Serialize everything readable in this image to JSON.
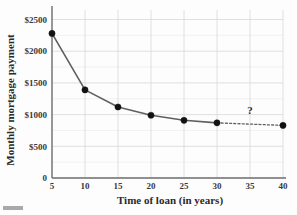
{
  "figure": {
    "background_color": "#fdfdfd",
    "line_color": "#5f5f5f",
    "marker_color": "#121212",
    "grid_color": "#d8d8d8",
    "minor_grid_color": "#ececec",
    "axis_color": "#6b6b6b"
  },
  "annotation": {
    "question_mark": "?"
  },
  "chart_data": {
    "type": "line",
    "title": "",
    "subtitle": "",
    "xlabel": "Time of loan (in years)",
    "ylabel": "Monthly mortgage payment",
    "x": [
      5,
      10,
      15,
      20,
      25,
      30,
      40
    ],
    "values": [
      2280,
      1390,
      1120,
      990,
      910,
      870,
      830
    ],
    "solid_segment_x": [
      5,
      10,
      15,
      20,
      25,
      30
    ],
    "solid_segment_values": [
      2280,
      1390,
      1120,
      990,
      910,
      870
    ],
    "dashed_segment_x": [
      30,
      40
    ],
    "dashed_segment_values": [
      870,
      830
    ],
    "xlim": [
      5,
      40
    ],
    "ylim": [
      0,
      2650
    ],
    "xticks": [
      5,
      10,
      15,
      20,
      25,
      30,
      35,
      40
    ],
    "xtick_labels": [
      "5",
      "10",
      "15",
      "20",
      "25",
      "30",
      "35",
      "40"
    ],
    "yticks": [
      0,
      500,
      1000,
      1500,
      2000,
      2500
    ],
    "ytick_labels": [
      "0",
      "$500",
      "$1000",
      "$1500",
      "$2000",
      "$2500"
    ],
    "minor_yticks": [
      250,
      750,
      1250,
      1750,
      2250
    ],
    "grid": true,
    "legend": false,
    "legend_position": "none",
    "annotations": [
      {
        "text": "?",
        "x": 35,
        "y": 1010
      }
    ]
  }
}
